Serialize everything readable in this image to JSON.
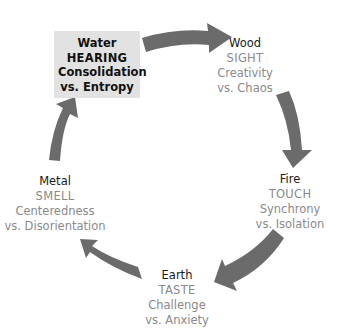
{
  "diagram": {
    "type": "cycle",
    "arrow_color": "#6b6b6b",
    "highlight_bg": "#e2e2e2",
    "nodes": [
      {
        "element": "Water",
        "sense": "HEARING",
        "positive": "Consolidation",
        "negative": "vs. Entropy",
        "highlighted": true
      },
      {
        "element": "Wood",
        "sense": "SIGHT",
        "positive": "Creativity",
        "negative": "vs. Chaos",
        "highlighted": false
      },
      {
        "element": "Fire",
        "sense": "TOUCH",
        "positive": "Synchrony",
        "negative": "vs. Isolation",
        "highlighted": false
      },
      {
        "element": "Earth",
        "sense": "TASTE",
        "positive": "Challenge",
        "negative": "vs. Anxiety",
        "highlighted": false
      },
      {
        "element": "Metal",
        "sense": "SMELL",
        "positive": "Centeredness",
        "negative": "vs. Disorientation",
        "highlighted": false
      }
    ],
    "arrows": [
      {
        "from": "Water",
        "to": "Wood"
      },
      {
        "from": "Wood",
        "to": "Fire"
      },
      {
        "from": "Fire",
        "to": "Earth"
      },
      {
        "from": "Earth",
        "to": "Metal"
      },
      {
        "from": "Metal",
        "to": "Water"
      }
    ]
  }
}
